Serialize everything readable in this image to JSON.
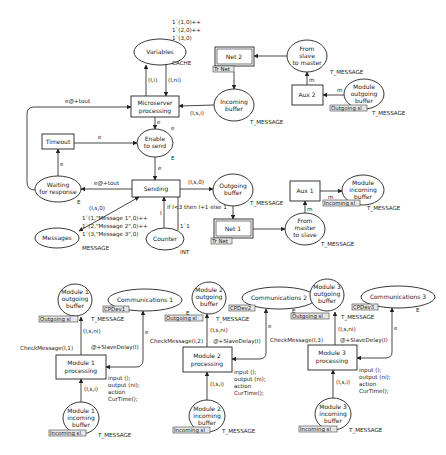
{
  "diagram": {
    "type": "Coloured Petri Net",
    "master": {
      "places": {
        "variables": {
          "label": "Variables",
          "colorset": "CACHE",
          "initial_marking": [
            "1`(1,0)++",
            "1`(2,0)++",
            "1`(3,0)"
          ]
        },
        "enable_to_send": {
          "label1": "Enable",
          "label2": "to send",
          "colorset": "E",
          "token": "e"
        },
        "waiting_for_response": {
          "label1": "Waiting",
          "label2": "for response",
          "colorset": "E"
        },
        "messages": {
          "label": "Messages",
          "colorset": "MESSAGE",
          "initial_marking": [
            "1`(1,\"Message 1\",0)++",
            "1`(2,\"Message 2\",0)++",
            "1`(3,\"Message 3\",0)"
          ]
        },
        "counter": {
          "label": "Counter",
          "colorset": "INT",
          "initial_marking": "1`1"
        },
        "outgoing_buffer": {
          "label1": "Outgoing",
          "label2": "buffer",
          "colorset": "T_MESSAGE"
        },
        "incoming_buffer": {
          "label1": "Incoming",
          "label2": "buffer",
          "colorset": "T_MESSAGE"
        },
        "from_master_to_slave": {
          "label1": "From",
          "label2": "master",
          "label3": "to slave",
          "colorset": "T_MESSAGE"
        },
        "from_slave_to_master": {
          "label1": "From",
          "label2": "slave",
          "label3": "to master",
          "colorset": "T_MESSAGE"
        },
        "module_incoming_buffer": {
          "label1": "Module",
          "label2": "incoming",
          "label3": "buffer",
          "colorset": "T_MESSAGE",
          "port_tag": "Incoming sl"
        },
        "module_outgoing_buffer": {
          "label1": "Module",
          "label2": "outgoing",
          "label3": "buffer",
          "colorset": "T_MESSAGE",
          "port_tag": "Outgoing sl"
        }
      },
      "transitions": {
        "microserver_processing": {
          "label1": "Microserver",
          "label2": "processing"
        },
        "timeout": {
          "label": "Timeout"
        },
        "sending": {
          "label": "Sending"
        },
        "net1": {
          "label": "Net 1",
          "subst_tag": "Tr Net"
        },
        "net2": {
          "label": "Net 2",
          "subst_tag": "Tr Net"
        },
        "aux1": {
          "label": "Aux 1"
        },
        "aux2": {
          "label": "Aux 2"
        }
      },
      "arcs": {
        "to_variables": "(I,i)",
        "from_variables": "(I,ni)",
        "incoming_to_micro": "(I,s,i)",
        "micro_to_enable": "e",
        "timeout_to_enable": "e",
        "enable_to_sending": "e",
        "waiting_to_timeout": "e",
        "sending_to_waiting": "e@+tout",
        "waiting_to_micro": "e@+tout",
        "sending_messages": "(I,s,0)",
        "sending_to_outgoing": "(I,s,0)",
        "counter_update": "if I<3 then I+1 else 1",
        "counter_to_sending": "I",
        "counter_initial": "1`1",
        "aux1_m": "m",
        "aux1_in_m": "m",
        "aux2_m": "m",
        "aux2_in_m": "m"
      }
    },
    "modules": [
      {
        "id": 1,
        "outgoing": {
          "label1": "Module 1",
          "label2": "outgoing",
          "label3": "buffer",
          "port_tag": "Outgoing sl",
          "colorset": "T_MESSAGE"
        },
        "incoming": {
          "label1": "Module 1",
          "label2": "incoming",
          "label3": "buffer",
          "port_tag": "Incoming sl",
          "colorset": "T_MESSAGE"
        },
        "communications": {
          "label": "Communications 1",
          "tag": "CPDev1",
          "colorset": "E"
        },
        "processing": {
          "label1": "Module 1",
          "label2": "processing"
        },
        "guard": "CheckMessage(I,1)",
        "arc_out": "(I,s,ni)",
        "arc_in": "(I,s,i)",
        "arc_comm": "e",
        "delay": "@+SlaveDelay(I)",
        "code": [
          "input ();",
          "output (ni);",
          "action",
          "CurTime();"
        ]
      },
      {
        "id": 2,
        "outgoing": {
          "label1": "Module 2",
          "label2": "outgoing",
          "label3": "buffer",
          "port_tag": "Outgoing sl",
          "colorset": "T_MESSAGE"
        },
        "incoming": {
          "label1": "Module 2",
          "label2": "incoming",
          "label3": "buffer",
          "port_tag": "Incoming sl",
          "colorset": "T_MESSAGE"
        },
        "communications": {
          "label": "Communications 2",
          "tag": "CPDev2",
          "colorset": "E"
        },
        "processing": {
          "label1": "Module 2",
          "label2": "processing"
        },
        "guard": "CheckMessage(I,2)",
        "arc_out": "(I,s,ni)",
        "arc_in": "(I,s,i)",
        "arc_comm": "e",
        "delay": "@+SlaveDelay(I)",
        "code": [
          "input ();",
          "output (ni);",
          "action",
          "CurTime();"
        ]
      },
      {
        "id": 3,
        "outgoing": {
          "label1": "Module 3",
          "label2": "outgoing",
          "label3": "buffer",
          "port_tag": "Outgoing sl",
          "colorset": "T_MESSAGE"
        },
        "incoming": {
          "label1": "Module 3",
          "label2": "incoming",
          "label3": "buffer",
          "port_tag": "Incoming sl",
          "colorset": "T_MESSAGE"
        },
        "communications": {
          "label": "Communications 3",
          "tag": "CPDev3",
          "colorset": "E"
        },
        "processing": {
          "label1": "Module 3",
          "label2": "processing"
        },
        "guard": "CheckMessage(I,3)",
        "arc_out": "(I,s,ni)",
        "arc_in": "(I,s,i)",
        "arc_comm": "e",
        "delay": "@+SlaveDelay(I)",
        "code": [
          "input ();",
          "output (ni);",
          "action",
          "CurTime();"
        ]
      }
    ]
  }
}
